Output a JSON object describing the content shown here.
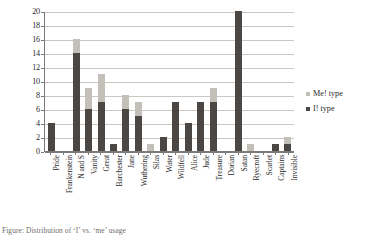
{
  "chart_data": {
    "type": "bar",
    "stacked": true,
    "title": "",
    "xlabel": "",
    "ylabel": "",
    "ylim": [
      0,
      20
    ],
    "ytick_step": 2,
    "yticks": [
      0,
      2,
      4,
      6,
      8,
      10,
      12,
      14,
      16,
      18,
      20
    ],
    "grid": true,
    "legend_position": "right",
    "categories": [
      "Pride",
      "Frankenstein",
      "N and S",
      "Vanity",
      "Great",
      "Barchester",
      "Jane",
      "Wuthering",
      "Silas",
      "Water",
      "Wildfell",
      "Alice",
      "Jude",
      "Treasure",
      "Dorian",
      "Satan",
      "Ryecroft",
      "Scarlet",
      "Captains",
      "Invisible"
    ],
    "series": [
      {
        "name": "I! type",
        "color": "#4a4745",
        "values": [
          4,
          0,
          14,
          6,
          7,
          1,
          6,
          5,
          0,
          2,
          7,
          4,
          7,
          7,
          0,
          20,
          0,
          0,
          1,
          1
        ]
      },
      {
        "name": "Me! type",
        "color": "#c3c0ba",
        "values": [
          0,
          0,
          2,
          3,
          4,
          0,
          2,
          2,
          1,
          0,
          0,
          0,
          0,
          2,
          0,
          0,
          1,
          0,
          0,
          1
        ]
      }
    ],
    "totals": [
      4,
      0,
      16,
      9,
      11,
      1,
      8,
      7,
      1,
      2,
      7,
      4,
      7,
      9,
      0,
      20,
      1,
      0,
      1,
      2
    ]
  },
  "legend": {
    "entries": [
      {
        "label": "Me! type",
        "swatch": "light"
      },
      {
        "label": "I! type",
        "swatch": "dark"
      }
    ]
  },
  "caption": {
    "text": "Figure: Distribution of ‘I’ vs. ‘me’ usage"
  },
  "colors": {
    "dark_series": "#4a4745",
    "light_series": "#c3c0ba",
    "gridline": "#c9c7c2",
    "axis": "#7a7a7a",
    "text": "#2b2b2b",
    "background": "#ffffff"
  }
}
